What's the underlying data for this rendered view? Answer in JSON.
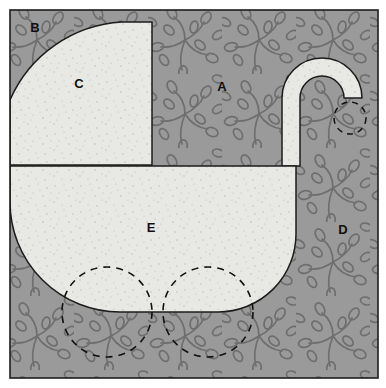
{
  "figure": {
    "width": 386,
    "height": 388,
    "colors": {
      "background_pattern_fill": "#9a9a9a",
      "background_pattern_stroke": "#6e6e6e",
      "shape_fill": "#e8e8e4",
      "shape_speckle": "#b9b9b3",
      "outline": "#1c1c1c",
      "dashed_stroke": "#111111",
      "label_color": "#101010",
      "page_background": "#ffffff"
    },
    "frame": {
      "x": 10,
      "y": 10,
      "width": 368,
      "height": 368,
      "stroke_width": 1.6
    }
  },
  "labels": [
    {
      "id": "A",
      "text": "A",
      "x": 222,
      "y": 88,
      "region": "background-field"
    },
    {
      "id": "B",
      "text": "B",
      "x": 35,
      "y": 29,
      "region": "top-left-corner-wedge"
    },
    {
      "id": "C",
      "text": "C",
      "x": 79,
      "y": 85,
      "region": "carriage-hood"
    },
    {
      "id": "D",
      "text": "D",
      "x": 343,
      "y": 231,
      "region": "right-field"
    },
    {
      "id": "E",
      "text": "E",
      "x": 151,
      "y": 229,
      "region": "carriage-body"
    }
  ],
  "shapes": {
    "hood": {
      "name": "carriage-hood",
      "description": "Quarter-round hood: rounded top-left corner, flat right and bottom edges",
      "left": 10,
      "top": 22,
      "right": 152,
      "bottom": 165,
      "corner_radius": 130
    },
    "body": {
      "name": "carriage-body",
      "description": "Body with flat top and rounded bottom corners",
      "left": 10,
      "top": 166,
      "right": 296,
      "bottom": 312,
      "bottom_left_radius": 110,
      "bottom_right_radius": 78
    },
    "handle": {
      "name": "carriage-handle",
      "description": "Hook shaped handle rising from body top and curving right and down",
      "bar_left": 282,
      "bar_right": 300,
      "bar_bottom": 166,
      "arc_top": 72,
      "arc_center_x": 322,
      "arc_center_y": 98,
      "tip_x": 350,
      "tip_y": 120,
      "thickness": 18
    },
    "wheels": [
      {
        "name": "wheel-left",
        "cx": 107,
        "cy": 312,
        "r": 45,
        "style": "dashed"
      },
      {
        "name": "wheel-right",
        "cx": 208,
        "cy": 312,
        "r": 45,
        "style": "dashed"
      },
      {
        "name": "handle-end-marker",
        "cx": 350,
        "cy": 118,
        "r": 16,
        "style": "dashed"
      }
    ]
  }
}
